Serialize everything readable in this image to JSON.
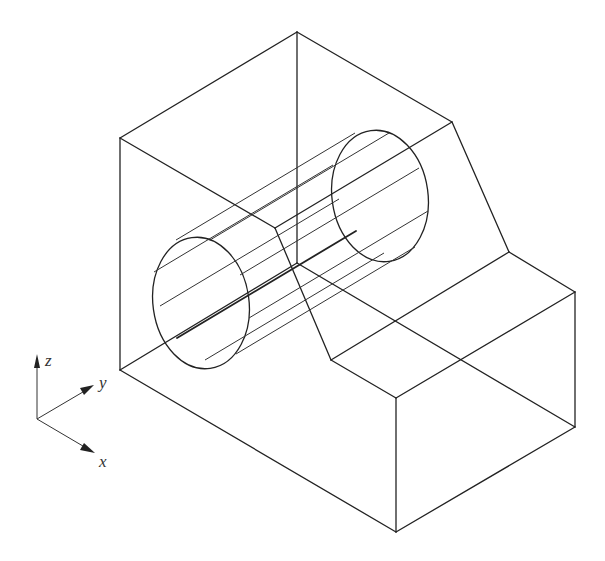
{
  "figure": {
    "stroke_color": "#222222",
    "background": "#ffffff"
  },
  "axes": {
    "origin": [
      37,
      419
    ],
    "labels": {
      "z": "z",
      "y": "y",
      "x": "x"
    }
  },
  "block": {
    "vertices": {
      "top_left": [
        120,
        138
      ],
      "top_back": [
        297,
        32
      ],
      "slope_top_right": [
        452,
        122
      ],
      "slope_bottom_right": [
        509,
        252
      ],
      "right_top": [
        575,
        292
      ],
      "right_bottom": [
        575,
        427
      ],
      "front_bottom": [
        396,
        532
      ],
      "front_top": [
        396,
        398
      ],
      "step_corner": [
        331,
        360
      ],
      "left_bottom": [
        120,
        370
      ],
      "inner_corner": [
        297,
        263
      ],
      "slope_top_inner": [
        275,
        228
      ]
    }
  },
  "cylinder": {
    "front_center": [
      201,
      303
    ],
    "back_center": [
      380,
      196
    ],
    "rx": 48,
    "ry": 66,
    "rotation": -8
  }
}
